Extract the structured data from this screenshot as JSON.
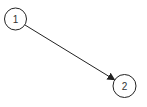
{
  "diagram": {
    "type": "directed-graph",
    "nodes": [
      {
        "id": "1",
        "label": "1",
        "cx": 15.5,
        "cy": 19,
        "r": 11
      },
      {
        "id": "2",
        "label": "2",
        "cx": 124.5,
        "cy": 86,
        "r": 11.5
      }
    ],
    "edges": [
      {
        "from": "1",
        "to": "2",
        "directed": true
      }
    ],
    "colors": {
      "stroke": "#222222",
      "text": "#333333",
      "background": "#ffffff"
    }
  }
}
